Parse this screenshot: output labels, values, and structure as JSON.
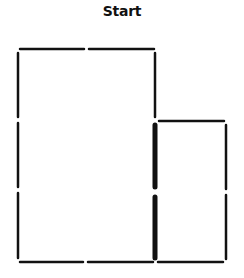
{
  "title": "Start",
  "colors": {
    "stroke": "#111111",
    "background": "#ffffff"
  },
  "matchsticks": [
    {
      "id": "top-1",
      "x1": 20,
      "y1": 49,
      "x2": 84,
      "y2": 49,
      "w": 2.5
    },
    {
      "id": "top-2",
      "x1": 89,
      "y1": 49,
      "x2": 154,
      "y2": 49,
      "w": 2.5
    },
    {
      "id": "left-1",
      "x1": 18,
      "y1": 53,
      "x2": 18,
      "y2": 117,
      "w": 2.5
    },
    {
      "id": "left-2",
      "x1": 18,
      "y1": 123,
      "x2": 18,
      "y2": 187,
      "w": 2.5
    },
    {
      "id": "left-3",
      "x1": 18,
      "y1": 193,
      "x2": 18,
      "y2": 258,
      "w": 2.5
    },
    {
      "id": "mid-1",
      "x1": 155,
      "y1": 53,
      "x2": 155,
      "y2": 117,
      "w": 2.5
    },
    {
      "id": "mid-2",
      "x1": 155,
      "y1": 125,
      "x2": 155,
      "y2": 187,
      "w": 5
    },
    {
      "id": "mid-3",
      "x1": 155,
      "y1": 197,
      "x2": 155,
      "y2": 258,
      "w": 5
    },
    {
      "id": "right-top",
      "x1": 159,
      "y1": 121,
      "x2": 224,
      "y2": 121,
      "w": 2.5
    },
    {
      "id": "right-1",
      "x1": 226,
      "y1": 125,
      "x2": 226,
      "y2": 189,
      "w": 2.5
    },
    {
      "id": "right-2",
      "x1": 226,
      "y1": 195,
      "x2": 226,
      "y2": 259,
      "w": 2.5
    },
    {
      "id": "bottom-1",
      "x1": 20,
      "y1": 262,
      "x2": 83,
      "y2": 262,
      "w": 2.5
    },
    {
      "id": "bottom-2",
      "x1": 88,
      "y1": 262,
      "x2": 153,
      "y2": 262,
      "w": 2.5
    },
    {
      "id": "bottom-3",
      "x1": 158,
      "y1": 262,
      "x2": 223,
      "y2": 262,
      "w": 2.5
    }
  ]
}
